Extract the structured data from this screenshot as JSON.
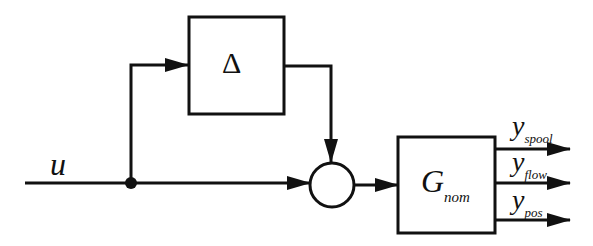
{
  "diagram": {
    "input_label": "u",
    "uncertainty_block": {
      "label": "Δ"
    },
    "summing_junction": {
      "label": ""
    },
    "plant_block": {
      "label_main": "G",
      "label_sub": "nom"
    },
    "outputs": [
      {
        "main": "y",
        "sub": "spool"
      },
      {
        "main": "y",
        "sub": "flow"
      },
      {
        "main": "y",
        "sub": "pos"
      }
    ],
    "colors": {
      "line": "#111111",
      "background": "#ffffff"
    }
  }
}
